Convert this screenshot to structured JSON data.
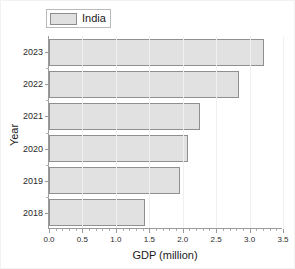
{
  "chart_data": {
    "type": "bar",
    "orientation": "horizontal",
    "title": "",
    "xlabel": "GDP (million)",
    "ylabel": "Year",
    "categories": [
      "2023",
      "2022",
      "2021",
      "2020",
      "2019",
      "2018"
    ],
    "values": [
      3.22,
      2.84,
      2.26,
      2.08,
      1.96,
      1.43
    ],
    "series": [
      {
        "name": "India",
        "values": [
          3.22,
          2.84,
          2.26,
          2.08,
          1.96,
          1.43
        ]
      }
    ],
    "xlim": [
      0.0,
      3.5
    ],
    "xticks": [
      "0.0",
      "0.5",
      "1.0",
      "1.5",
      "2.0",
      "2.5",
      "3.0",
      "3.5"
    ],
    "xtick_values": [
      0.0,
      0.5,
      1.0,
      1.5,
      2.0,
      2.5,
      3.0,
      3.5
    ],
    "yticks": [
      "2023",
      "2022",
      "2021",
      "2020",
      "2019",
      "2018"
    ],
    "grid": true,
    "legend": {
      "position": "top-left",
      "entries": [
        "India"
      ]
    },
    "colors": {
      "bar_fill": "#e1e1e1",
      "bar_edge": "#8f8f8f",
      "axis": "#9a9a9a",
      "text": "#1a1a1a",
      "grid": "#f0f0f0",
      "background": "#ffffff"
    }
  },
  "legend": {
    "label": "India"
  },
  "axes": {
    "x_title": "GDP (million)",
    "y_title": "Year"
  }
}
